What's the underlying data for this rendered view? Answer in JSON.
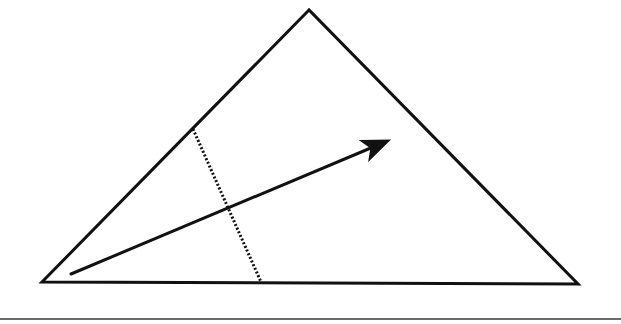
{
  "diagram": {
    "type": "geometry",
    "colors": {
      "stroke": "#111111",
      "background": "#ffffff",
      "rule": "#6b6b6b"
    },
    "triangle": {
      "vertices": [
        {
          "name": "apex",
          "x": 309,
          "y": 10
        },
        {
          "name": "bottom-left",
          "x": 42,
          "y": 282
        },
        {
          "name": "bottom-right",
          "x": 578,
          "y": 284
        }
      ],
      "stroke_width": 3
    },
    "arrow": {
      "tail": {
        "x": 71,
        "y": 274
      },
      "head": {
        "x": 404,
        "y": 134
      },
      "stroke_width": 3
    },
    "dotted_segment": {
      "start": {
        "x": 193,
        "y": 129
      },
      "end": {
        "x": 261,
        "y": 282
      },
      "stroke_width": 3,
      "dash": "2,2"
    },
    "bottom_rule": {
      "y": 319,
      "x1": 0,
      "x2": 621
    }
  }
}
